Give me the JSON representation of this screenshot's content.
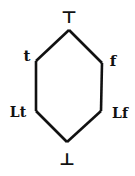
{
  "diagram": {
    "type": "lattice (Hasse diagram)",
    "nodes": {
      "top": {
        "label": "⊤",
        "x": 69,
        "y": 30
      },
      "t": {
        "label": "t",
        "x": 36,
        "y": 61
      },
      "f": {
        "label": "f",
        "x": 102,
        "y": 63
      },
      "lt": {
        "label": "Lt",
        "x": 36,
        "y": 111
      },
      "lf": {
        "label": "Lf",
        "x": 101,
        "y": 111
      },
      "bottom": {
        "label": "⊥",
        "x": 67,
        "y": 142
      }
    },
    "edges": [
      [
        "top",
        "t"
      ],
      [
        "top",
        "f"
      ],
      [
        "t",
        "lt"
      ],
      [
        "f",
        "lf"
      ],
      [
        "lt",
        "bottom"
      ],
      [
        "lf",
        "bottom"
      ]
    ],
    "line_color": "#111111"
  }
}
